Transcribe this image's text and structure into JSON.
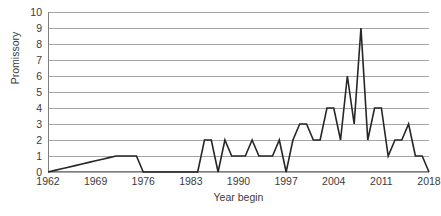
{
  "chart_data": {
    "type": "line",
    "title": "",
    "xlabel": "Year begin",
    "ylabel": "Promissory",
    "xlim": [
      1962,
      2018
    ],
    "ylim": [
      0,
      10
    ],
    "grid": true,
    "legend": false,
    "legend_position": "none",
    "line_color": "#262626",
    "grid_color": "#a6a6a6",
    "axis_color": "#7f7f7f",
    "ytick_labels": [
      "10",
      "9",
      "8",
      "7",
      "6",
      "5",
      "4",
      "3",
      "2",
      "1",
      "0"
    ],
    "ytick_values": [
      10,
      9,
      8,
      7,
      6,
      5,
      4,
      3,
      2,
      1,
      0
    ],
    "xtick_labels": [
      "1962",
      "1969",
      "1976",
      "1983",
      "1990",
      "1997",
      "2004",
      "2011",
      "2018"
    ],
    "xtick_values": [
      1962,
      1969,
      1976,
      1983,
      1990,
      1997,
      2004,
      2011,
      2018
    ],
    "series": [
      {
        "name": "Promissory",
        "x": [
          1962,
          1963,
          1964,
          1965,
          1966,
          1967,
          1968,
          1969,
          1970,
          1971,
          1972,
          1973,
          1974,
          1975,
          1976,
          1977,
          1978,
          1979,
          1980,
          1981,
          1982,
          1983,
          1984,
          1985,
          1986,
          1987,
          1988,
          1989,
          1990,
          1991,
          1992,
          1993,
          1994,
          1995,
          1996,
          1997,
          1998,
          1999,
          2000,
          2001,
          2002,
          2003,
          2004,
          2005,
          2006,
          2007,
          2008,
          2009,
          2010,
          2011,
          2012,
          2013,
          2014,
          2015,
          2016,
          2017,
          2018
        ],
        "y": [
          0,
          0.1,
          0.2,
          0.3,
          0.4,
          0.5,
          0.6,
          0.7,
          0.8,
          0.9,
          1,
          1,
          1,
          1,
          0,
          0,
          0,
          0,
          0,
          0,
          0,
          0,
          0,
          2,
          2,
          0,
          2,
          1,
          1,
          1,
          2,
          1,
          1,
          1,
          2,
          0,
          2,
          3,
          3,
          2,
          2,
          4,
          4,
          2,
          6,
          3,
          9,
          2,
          4,
          4,
          1,
          2,
          2,
          3,
          1,
          1,
          0
        ]
      }
    ]
  }
}
